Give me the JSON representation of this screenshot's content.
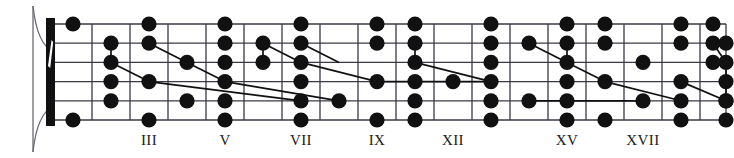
{
  "figure": {
    "name": "guitar-fretboard-diagram",
    "kind": "fretboard",
    "width": 734,
    "height": 158,
    "background_color": "#ffffff",
    "line_color": "#3a3a46",
    "dot_color": "#111111",
    "nut_color": "#111111"
  },
  "geometry": {
    "board_left": 54,
    "board_right": 726,
    "string_top_y": 24,
    "string_bottom_y": 120,
    "string_count": 6,
    "string_spacing": 19.2,
    "fret_x": [
      54,
      92,
      130,
      168,
      206,
      244,
      282,
      320,
      358,
      396,
      434,
      472,
      510,
      548,
      586,
      624,
      662,
      700,
      726
    ],
    "nut_x": 46,
    "nut_width": 9
  },
  "headstock": {
    "name": "headstock-outline",
    "top_curve": "M 33 6 C 36 34 44 48 54 52",
    "bottom_curve": "M 33 152 C 36 124 44 110 54 106",
    "edge_line": "M 33 6 L 33 152"
  },
  "nut": {
    "name": "nut",
    "label": "nut",
    "slash_marking": "white-diagonal-slash"
  },
  "fret_labels": [
    {
      "label": "III",
      "fret": 3,
      "x": 149
    },
    {
      "label": "V",
      "fret": 5,
      "x": 225
    },
    {
      "label": "VII",
      "fret": 7,
      "x": 301
    },
    {
      "label": "IX",
      "fret": 9,
      "x": 377
    },
    {
      "label": "XII",
      "fret": 12,
      "x": 453
    },
    {
      "label": "XV",
      "fret": 15,
      "x": 567
    },
    {
      "label": "XVII",
      "fret": 17,
      "x": 643
    }
  ],
  "chart_data": {
    "type": "scatter",
    "title": "",
    "xlabel": "",
    "ylabel": "",
    "x_tick_labels": [
      "III",
      "V",
      "VII",
      "IX",
      "XII",
      "XV",
      "XVII"
    ],
    "x_tick_values": [
      3,
      5,
      7,
      9,
      12,
      15,
      17
    ],
    "xlim": [
      0,
      18
    ],
    "ylim": [
      1,
      6
    ],
    "grid": true,
    "legend": "none",
    "dots": [
      {
        "string": 1,
        "fret": 1
      },
      {
        "string": 6,
        "fret": 1
      },
      {
        "string": 2,
        "fret": 2
      },
      {
        "string": 3,
        "fret": 2
      },
      {
        "string": 4,
        "fret": 2
      },
      {
        "string": 5,
        "fret": 2
      },
      {
        "string": 1,
        "fret": 3
      },
      {
        "string": 2,
        "fret": 3
      },
      {
        "string": 4,
        "fret": 3
      },
      {
        "string": 6,
        "fret": 3
      },
      {
        "string": 3,
        "fret": 4
      },
      {
        "string": 5,
        "fret": 4
      },
      {
        "string": 1,
        "fret": 5
      },
      {
        "string": 2,
        "fret": 5
      },
      {
        "string": 3,
        "fret": 5
      },
      {
        "string": 4,
        "fret": 5
      },
      {
        "string": 5,
        "fret": 5
      },
      {
        "string": 6,
        "fret": 5
      },
      {
        "string": 2,
        "fret": 6
      },
      {
        "string": 3,
        "fret": 6
      },
      {
        "string": 1,
        "fret": 7
      },
      {
        "string": 2,
        "fret": 7
      },
      {
        "string": 3,
        "fret": 7
      },
      {
        "string": 4,
        "fret": 7
      },
      {
        "string": 5,
        "fret": 7
      },
      {
        "string": 6,
        "fret": 7
      },
      {
        "string": 5,
        "fret": 8
      },
      {
        "string": 1,
        "fret": 9
      },
      {
        "string": 2,
        "fret": 9
      },
      {
        "string": 4,
        "fret": 9
      },
      {
        "string": 6,
        "fret": 9
      },
      {
        "string": 1,
        "fret": 10
      },
      {
        "string": 2,
        "fret": 10
      },
      {
        "string": 3,
        "fret": 10
      },
      {
        "string": 4,
        "fret": 10
      },
      {
        "string": 5,
        "fret": 10
      },
      {
        "string": 6,
        "fret": 10
      },
      {
        "string": 4,
        "fret": 11
      },
      {
        "string": 1,
        "fret": 12
      },
      {
        "string": 2,
        "fret": 12
      },
      {
        "string": 3,
        "fret": 12
      },
      {
        "string": 4,
        "fret": 12
      },
      {
        "string": 5,
        "fret": 12
      },
      {
        "string": 6,
        "fret": 12
      },
      {
        "string": 2,
        "fret": 13
      },
      {
        "string": 5,
        "fret": 13
      },
      {
        "string": 1,
        "fret": 14
      },
      {
        "string": 2,
        "fret": 14
      },
      {
        "string": 3,
        "fret": 14
      },
      {
        "string": 4,
        "fret": 14
      },
      {
        "string": 5,
        "fret": 14
      },
      {
        "string": 6,
        "fret": 14
      },
      {
        "string": 1,
        "fret": 15
      },
      {
        "string": 2,
        "fret": 15
      },
      {
        "string": 4,
        "fret": 15
      },
      {
        "string": 6,
        "fret": 15
      },
      {
        "string": 3,
        "fret": 16
      },
      {
        "string": 5,
        "fret": 16
      },
      {
        "string": 1,
        "fret": 17
      },
      {
        "string": 2,
        "fret": 17
      },
      {
        "string": 4,
        "fret": 17
      },
      {
        "string": 5,
        "fret": 17
      },
      {
        "string": 6,
        "fret": 17
      },
      {
        "string": 1,
        "fret": 18
      },
      {
        "string": 2,
        "fret": 18
      },
      {
        "string": 3,
        "fret": 18
      },
      {
        "string": 3,
        "fret": 19
      },
      {
        "string": 4,
        "fret": 19
      },
      {
        "string": 5,
        "fret": 19
      },
      {
        "string": 6,
        "fret": 19
      },
      {
        "string": 2,
        "fret": 20
      },
      {
        "string": 5,
        "fret": 20
      }
    ],
    "connectors": [
      {
        "from": {
          "string": 2,
          "fret": 2
        },
        "to": {
          "string": 3,
          "fret": 2
        }
      },
      {
        "from": {
          "string": 3,
          "fret": 2
        },
        "to": {
          "string": 4,
          "fret": 3
        }
      },
      {
        "from": {
          "string": 4,
          "fret": 3
        },
        "to": {
          "string": 5,
          "fret": 7
        }
      },
      {
        "from": {
          "string": 2,
          "fret": 3
        },
        "to": {
          "string": 3,
          "fret": 4
        }
      },
      {
        "from": {
          "string": 3,
          "fret": 4
        },
        "to": {
          "string": 4,
          "fret": 5
        }
      },
      {
        "from": {
          "string": 4,
          "fret": 5
        },
        "to": {
          "string": 5,
          "fret": 8
        }
      },
      {
        "from": {
          "string": 2,
          "fret": 6
        },
        "to": {
          "string": 3,
          "fret": 6
        }
      },
      {
        "from": {
          "string": 2,
          "fret": 6
        },
        "to": {
          "string": 3,
          "fret": 7
        }
      },
      {
        "from": {
          "string": 3,
          "fret": 7
        },
        "to": {
          "string": 4,
          "fret": 9
        }
      },
      {
        "from": {
          "string": 2,
          "fret": 7
        },
        "to": {
          "string": 3,
          "fret": 8
        }
      },
      {
        "from": {
          "string": 4,
          "fret": 9
        },
        "to": {
          "string": 4,
          "fret": 11
        }
      },
      {
        "from": {
          "string": 3,
          "fret": 10
        },
        "to": {
          "string": 4,
          "fret": 12
        }
      },
      {
        "from": {
          "string": 2,
          "fret": 10
        },
        "to": {
          "string": 3,
          "fret": 10
        }
      },
      {
        "from": {
          "string": 4,
          "fret": 11
        },
        "to": {
          "string": 4,
          "fret": 12
        }
      },
      {
        "from": {
          "string": 2,
          "fret": 13
        },
        "to": {
          "string": 3,
          "fret": 14
        }
      },
      {
        "from": {
          "string": 3,
          "fret": 14
        },
        "to": {
          "string": 4,
          "fret": 15
        }
      },
      {
        "from": {
          "string": 2,
          "fret": 14
        },
        "to": {
          "string": 3,
          "fret": 14
        }
      },
      {
        "from": {
          "string": 5,
          "fret": 13
        },
        "to": {
          "string": 5,
          "fret": 16
        }
      },
      {
        "from": {
          "string": 4,
          "fret": 15
        },
        "to": {
          "string": 5,
          "fret": 17
        }
      },
      {
        "from": {
          "string": 2,
          "fret": 18
        },
        "to": {
          "string": 3,
          "fret": 19
        }
      },
      {
        "from": {
          "string": 3,
          "fret": 19
        },
        "to": {
          "string": 5,
          "fret": 20
        }
      },
      {
        "from": {
          "string": 4,
          "fret": 17
        },
        "to": {
          "string": 5,
          "fret": 20
        }
      }
    ]
  }
}
